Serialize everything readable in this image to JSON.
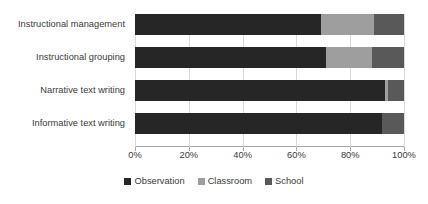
{
  "chart_data": {
    "type": "bar",
    "orientation": "horizontal",
    "stacked": true,
    "stack_total_percent": 100,
    "title": "",
    "subtitle": "",
    "xlabel": "",
    "ylabel": "",
    "xlim": [
      0,
      100
    ],
    "xtick_labels": [
      "0%",
      "20%",
      "40%",
      "60%",
      "80%",
      "100%"
    ],
    "xtick_values": [
      0,
      20,
      40,
      60,
      80,
      100
    ],
    "grid": true,
    "grid_axis": "x",
    "legend_position": "bottom",
    "categories": [
      "Instructional management",
      "Instructional grouping",
      "Narrative text writing",
      "Informative text writing"
    ],
    "series": [
      {
        "name": "Observation",
        "color": "#262626",
        "values": [
          69,
          71,
          93,
          92
        ]
      },
      {
        "name": "Classroom",
        "color": "#9e9e9e",
        "values": [
          20,
          17,
          1,
          0
        ]
      },
      {
        "name": "School",
        "color": "#595959",
        "values": [
          11,
          12,
          6,
          8
        ]
      }
    ]
  },
  "axis": {
    "line_color": "#a6a6a6",
    "gridline_color": "#d9d9d9"
  },
  "legend": {
    "items": [
      {
        "label": "Observation",
        "color": "#262626"
      },
      {
        "label": "Classroom",
        "color": "#9e9e9e"
      },
      {
        "label": "School",
        "color": "#595959"
      }
    ]
  }
}
